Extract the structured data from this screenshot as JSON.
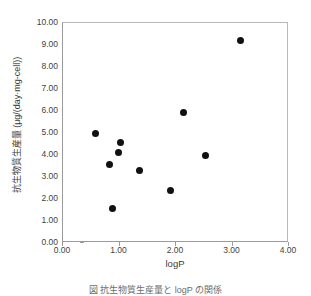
{
  "chart_data": {
    "type": "scatter",
    "title": "",
    "xlabel": "logP",
    "ylabel": "抗生物質生産量 (μg/(day·mg-cell))",
    "xlim": [
      0.0,
      4.0
    ],
    "ylim": [
      0.0,
      10.0
    ],
    "grid": false,
    "legend": null,
    "xticks": [
      "0.00",
      "1.00",
      "2.00",
      "3.00",
      "4.00"
    ],
    "xtick_values": [
      0.0,
      1.0,
      2.0,
      3.0,
      4.0
    ],
    "yticks": [
      "0.00",
      "1.00",
      "2.00",
      "3.00",
      "4.00",
      "5.00",
      "6.00",
      "7.00",
      "8.00",
      "9.00",
      "10.00"
    ],
    "ytick_values": [
      0.0,
      1.0,
      2.0,
      3.0,
      4.0,
      5.0,
      6.0,
      7.0,
      8.0,
      9.0,
      10.0
    ],
    "marker": "filled-circle",
    "marker_color": "#111111",
    "points": [
      {
        "x": 0.58,
        "y": 5.0
      },
      {
        "x": 0.82,
        "y": 3.55
      },
      {
        "x": 0.87,
        "y": 1.55
      },
      {
        "x": 0.98,
        "y": 4.1
      },
      {
        "x": 1.02,
        "y": 4.55
      },
      {
        "x": 1.35,
        "y": 3.3
      },
      {
        "x": 1.9,
        "y": 2.38
      },
      {
        "x": 2.13,
        "y": 5.95
      },
      {
        "x": 2.53,
        "y": 4.0
      },
      {
        "x": 3.14,
        "y": 9.22
      }
    ]
  },
  "caption": "図    抗生物質生産量と logP の関係",
  "axis_color": "#9b9b9b"
}
